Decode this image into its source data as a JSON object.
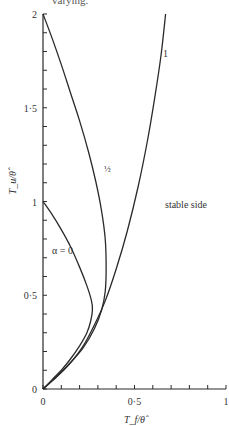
{
  "header_fragment": "varying.",
  "chart_data": {
    "type": "line",
    "title": "",
    "xlabel": "T_f/θ̂",
    "ylabel": "T_u/θ̂",
    "xlim": [
      0,
      1
    ],
    "ylim": [
      0,
      2
    ],
    "x_ticks": [
      {
        "value": 0,
        "label": "0"
      },
      {
        "value": 0.5,
        "label": "0·5"
      },
      {
        "value": 1,
        "label": "1"
      }
    ],
    "y_ticks": [
      {
        "value": 0,
        "label": "0"
      },
      {
        "value": 0.5,
        "label": "0·5"
      },
      {
        "value": 1,
        "label": "1"
      },
      {
        "value": 1.5,
        "label": "1·5"
      },
      {
        "value": 2,
        "label": "2"
      }
    ],
    "minor_tick_step": 0.1,
    "grid": false,
    "series": [
      {
        "name": "α = 0",
        "label": "α = 0",
        "points": [
          [
            0,
            1.0
          ],
          [
            0.05,
            0.93
          ],
          [
            0.1,
            0.85
          ],
          [
            0.15,
            0.76
          ],
          [
            0.2,
            0.65
          ],
          [
            0.24,
            0.55
          ],
          [
            0.265,
            0.47
          ],
          [
            0.27,
            0.42
          ],
          [
            0.26,
            0.36
          ],
          [
            0.24,
            0.3
          ],
          [
            0.2,
            0.23
          ],
          [
            0.15,
            0.16
          ],
          [
            0.1,
            0.1
          ],
          [
            0.05,
            0.05
          ],
          [
            0,
            0
          ]
        ]
      },
      {
        "name": "α = 1/2",
        "label": "½",
        "points": [
          [
            0,
            2.0
          ],
          [
            0.05,
            1.87
          ],
          [
            0.1,
            1.73
          ],
          [
            0.15,
            1.58
          ],
          [
            0.2,
            1.43
          ],
          [
            0.25,
            1.26
          ],
          [
            0.29,
            1.1
          ],
          [
            0.32,
            0.95
          ],
          [
            0.34,
            0.8
          ],
          [
            0.345,
            0.65
          ],
          [
            0.34,
            0.52
          ],
          [
            0.32,
            0.42
          ],
          [
            0.28,
            0.32
          ],
          [
            0.22,
            0.22
          ],
          [
            0.15,
            0.14
          ],
          [
            0.08,
            0.07
          ],
          [
            0,
            0
          ]
        ]
      },
      {
        "name": "α = 1",
        "label": "1",
        "points": [
          [
            0,
            0
          ],
          [
            0.08,
            0.07
          ],
          [
            0.15,
            0.14
          ],
          [
            0.22,
            0.23
          ],
          [
            0.28,
            0.34
          ],
          [
            0.34,
            0.47
          ],
          [
            0.4,
            0.64
          ],
          [
            0.46,
            0.84
          ],
          [
            0.52,
            1.08
          ],
          [
            0.57,
            1.32
          ],
          [
            0.61,
            1.55
          ],
          [
            0.645,
            1.78
          ],
          [
            0.67,
            2.0
          ]
        ]
      }
    ],
    "annotations": [
      {
        "text": "stable side",
        "x": 0.72,
        "y": 1.0
      }
    ],
    "legend": "inline labels on curves"
  }
}
